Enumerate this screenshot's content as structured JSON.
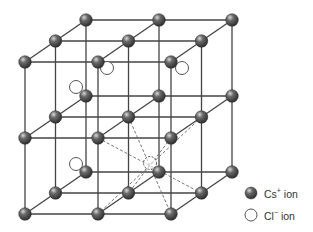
{
  "diagram": {
    "grid": {
      "origin": [
        25,
        62
      ],
      "dx": 73,
      "dy": 76,
      "depth_offset": [
        30.5,
        -21
      ],
      "size": 3
    },
    "cl_ions": [
      [
        107,
        68
      ],
      [
        182,
        68
      ],
      [
        76,
        87
      ],
      [
        76,
        164
      ],
      [
        150,
        163
      ]
    ],
    "center_ion": [
      150,
      163
    ],
    "dashed_diagonals": [
      [
        [
          98,
          138
        ],
        [
          201,
          193
        ]
      ],
      [
        [
          128.5,
          117
        ],
        [
          171,
          214
        ]
      ],
      [
        [
          171,
          138
        ],
        [
          128.5,
          193
        ]
      ],
      [
        [
          201.5,
          117
        ],
        [
          98,
          214
        ]
      ]
    ],
    "colors": {
      "line": "#444444",
      "cs_fill": "#4a4a4a",
      "cs_highlight": "#bdbdbd",
      "cl_stroke": "#555555",
      "dash": "#666666"
    }
  },
  "legend": {
    "cs": {
      "symbol": "Cs",
      "charge": "+",
      "suffix": " ion"
    },
    "cl": {
      "symbol": "Cl",
      "charge": "−",
      "suffix": " ion"
    }
  }
}
